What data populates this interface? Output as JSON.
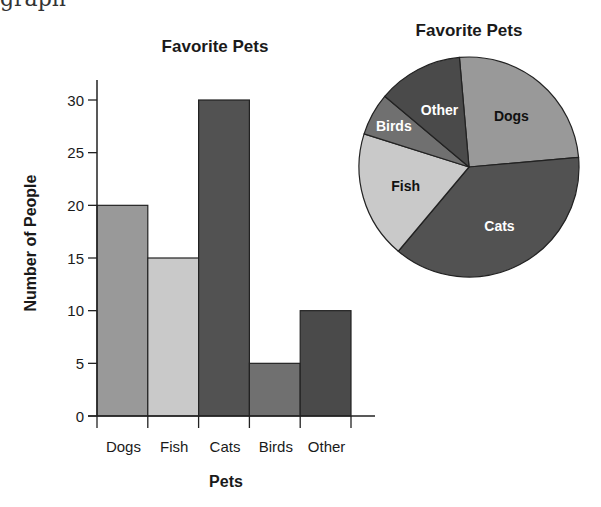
{
  "page": {
    "cut_off_text": "graph"
  },
  "colors": {
    "Dogs": "#999999",
    "Fish": "#c9c9c9",
    "Cats": "#525252",
    "Birds": "#707070",
    "Other": "#4a4a4a",
    "axis": "#222222",
    "text": "#1a1a1a"
  },
  "chart_data": [
    {
      "type": "bar",
      "title": "Favorite Pets",
      "xlabel": "Pets",
      "ylabel": "Number of People",
      "categories": [
        "Dogs",
        "Fish",
        "Cats",
        "Birds",
        "Other"
      ],
      "values": [
        20,
        15,
        30,
        5,
        10
      ],
      "ylim": [
        0,
        30
      ],
      "yticks": [
        0,
        5,
        10,
        15,
        20,
        25,
        30
      ],
      "grid": false,
      "legend": "none"
    },
    {
      "type": "pie",
      "title": "Favorite Pets",
      "categories": [
        "Dogs",
        "Cats",
        "Fish",
        "Birds",
        "Other"
      ],
      "values": [
        20,
        30,
        15,
        5,
        10
      ],
      "percentages": [
        25,
        37.5,
        18.75,
        6.25,
        12.5
      ],
      "label_colors": [
        "#111111",
        "#ffffff",
        "#111111",
        "#ffffff",
        "#ffffff"
      ],
      "legend": "labels on slices"
    }
  ]
}
